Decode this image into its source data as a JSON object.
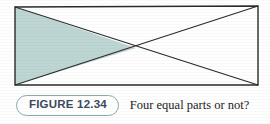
{
  "figure": {
    "label": "FIGURE 12.34",
    "caption": "Four equal parts or not?",
    "pill_border_color": "#8aa9a8",
    "label_color": "#3c4a5e",
    "caption_color": "#1c1c1c",
    "background_color": "#fefefe"
  },
  "chart_data": {
    "type": "diagram",
    "title": "Four equal parts or not?",
    "shape": "rectangle-with-both-diagonals",
    "stroke_color": "#2b2b2b",
    "stroke_width": 1.3,
    "fill_color": "#bdd5d3",
    "rectangle": {
      "corners": {
        "top_left": [
          15,
          7
        ],
        "top_right": [
          258,
          6
        ],
        "bottom_right": [
          258,
          85
        ],
        "bottom_left": [
          15,
          85
        ]
      },
      "width": 243,
      "height": 79
    },
    "diagonals": [
      {
        "name": "top-left-to-bottom-right",
        "from": [
          15,
          7
        ],
        "to": [
          258,
          85
        ]
      },
      {
        "name": "top-right-to-bottom-left",
        "from": [
          258,
          6
        ],
        "to": [
          15,
          85
        ]
      }
    ],
    "intersection_point": [
      136,
      48
    ],
    "regions": [
      {
        "name": "left-triangle",
        "vertices": [
          [
            15,
            7
          ],
          [
            136,
            48
          ],
          [
            15,
            85
          ]
        ],
        "shaded": true
      },
      {
        "name": "top-triangle",
        "vertices": [
          [
            15,
            7
          ],
          [
            258,
            6
          ],
          [
            136,
            48
          ]
        ],
        "shaded": false
      },
      {
        "name": "right-triangle",
        "vertices": [
          [
            258,
            6
          ],
          [
            258,
            85
          ],
          [
            136,
            48
          ]
        ],
        "shaded": false
      },
      {
        "name": "bottom-triangle",
        "vertices": [
          [
            15,
            85
          ],
          [
            258,
            85
          ],
          [
            136,
            48
          ]
        ],
        "shaded": false
      }
    ]
  }
}
